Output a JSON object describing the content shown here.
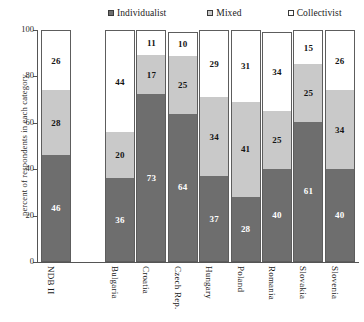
{
  "legend": {
    "items": [
      {
        "label": "Individualist",
        "swatch": "filled-dark-square",
        "color": "#6e6e6e"
      },
      {
        "label": "Mixed",
        "swatch": "filled-light-square",
        "color": "#c9c9c9"
      },
      {
        "label": "Collectivist",
        "swatch": "open-square",
        "color": "#ffffff"
      }
    ]
  },
  "axes": {
    "ylabel": "percent of respondents in each category",
    "yticks": [
      "0",
      "20",
      "40",
      "60",
      "80",
      "100"
    ],
    "ymin": 0,
    "ymax": 100
  },
  "chart_data": {
    "type": "bar",
    "stacked": true,
    "title": "",
    "xlabel": "",
    "ylabel": "percent of respondents in each category",
    "ylim": [
      0,
      100
    ],
    "yticks": [
      0,
      20,
      40,
      60,
      80,
      100
    ],
    "grid": false,
    "legend_position": "top",
    "categories": [
      "NDB II",
      "Bulgaria",
      "Croatia",
      "Czech Rep.",
      "Hungary",
      "Poland",
      "Romania",
      "Slovakia",
      "Slovenia"
    ],
    "series": [
      {
        "name": "Individualist",
        "color": "#6e6e6e",
        "values": [
          46,
          36,
          73,
          64,
          37,
          28,
          40,
          61,
          40
        ]
      },
      {
        "name": "Mixed",
        "color": "#c9c9c9",
        "values": [
          28,
          20,
          17,
          25,
          34,
          41,
          25,
          25,
          34
        ]
      },
      {
        "name": "Collectivist",
        "color": "#ffffff",
        "values": [
          26,
          44,
          11,
          10,
          29,
          31,
          34,
          15,
          26
        ]
      }
    ]
  }
}
